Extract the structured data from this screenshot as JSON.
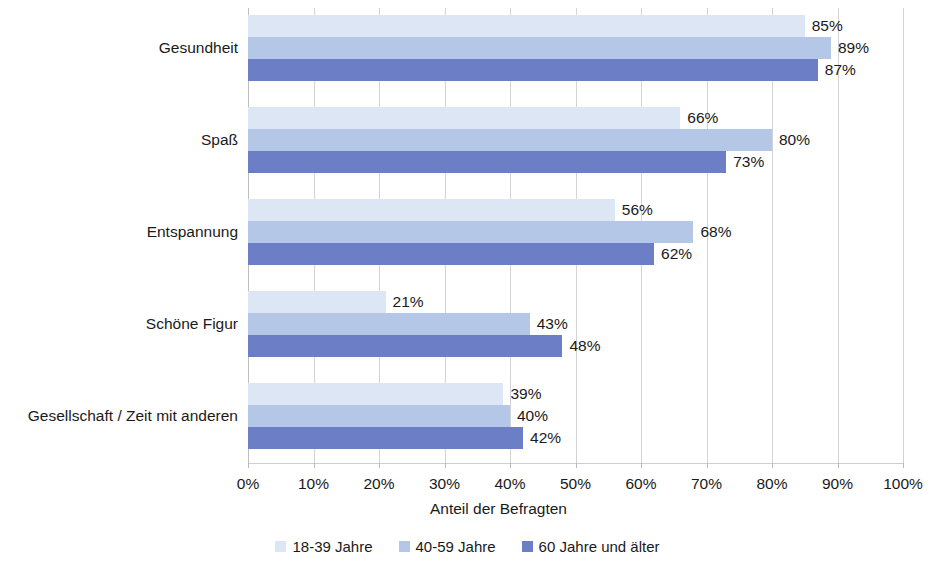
{
  "chart_data": {
    "type": "bar",
    "orientation": "horizontal",
    "title": "",
    "xlabel": "Anteil der Befragten",
    "ylabel": "",
    "xlim": [
      0,
      100
    ],
    "xtick_labels": [
      "0%",
      "10%",
      "20%",
      "30%",
      "40%",
      "50%",
      "60%",
      "70%",
      "80%",
      "90%",
      "100%"
    ],
    "xticks": [
      0,
      10,
      20,
      30,
      40,
      50,
      60,
      70,
      80,
      90,
      100
    ],
    "grid": true,
    "legend_position": "bottom",
    "categories": [
      "Gesundheit",
      "Spaß",
      "Entspannung",
      "Schöne Figur",
      "Gesellschaft / Zeit mit anderen"
    ],
    "series": [
      {
        "name": "18-39 Jahre",
        "color": "#dce6f4",
        "values": [
          85,
          66,
          56,
          21,
          39
        ],
        "labels": [
          "85%",
          "66%",
          "56%",
          "21%",
          "39%"
        ]
      },
      {
        "name": "40-59 Jahre",
        "color": "#b4c7e7",
        "values": [
          89,
          80,
          68,
          43,
          40
        ],
        "labels": [
          "89%",
          "80%",
          "68%",
          "43%",
          "40%"
        ]
      },
      {
        "name": "60 Jahre und älter",
        "color": "#6c7fc6",
        "values": [
          87,
          73,
          62,
          48,
          42
        ],
        "labels": [
          "87%",
          "73%",
          "62%",
          "48%",
          "42%"
        ]
      }
    ]
  }
}
